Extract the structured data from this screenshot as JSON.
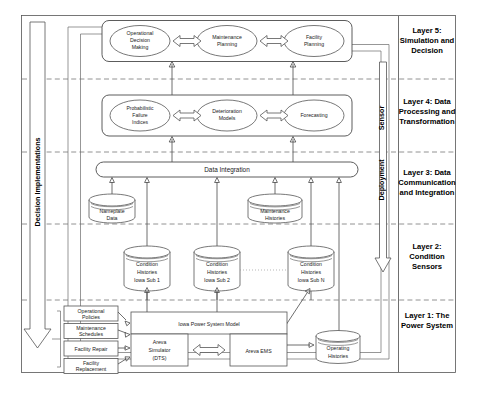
{
  "diagram": {
    "vertical_labels": {
      "left": "Decision Implementations",
      "right_top": "Sensor",
      "right_bottom": "Deployment"
    },
    "layers": [
      {
        "id": "layer5",
        "label_lines": [
          "Layer 5:",
          "Simulation and",
          "Decision"
        ]
      },
      {
        "id": "layer4",
        "label_lines": [
          "Layer 4: Data",
          "Processing and",
          "Transformation"
        ]
      },
      {
        "id": "layer3",
        "label_lines": [
          "Layer 3: Data",
          "Communication",
          "and Integration"
        ]
      },
      {
        "id": "layer2",
        "label_lines": [
          "Layer 2:",
          "Condition",
          "Sensors"
        ]
      },
      {
        "id": "layer1",
        "label_lines": [
          "Layer 1: The",
          "Power System"
        ]
      }
    ],
    "layer5_nodes": [
      {
        "id": "operational-decision-making",
        "lines": [
          "Operational",
          "Decision",
          "Making"
        ]
      },
      {
        "id": "maintenance-planning",
        "lines": [
          "Maintenance",
          "Planning"
        ]
      },
      {
        "id": "facility-planning",
        "lines": [
          "Facility",
          "Planning"
        ]
      }
    ],
    "layer4_nodes": [
      {
        "id": "probabilistic-failure-indices",
        "lines": [
          "Probabilistic",
          "Failure",
          "Indices"
        ]
      },
      {
        "id": "deterioration-models",
        "lines": [
          "Deterioration",
          "Models"
        ]
      },
      {
        "id": "forecasting",
        "lines": [
          "Forecasting"
        ]
      }
    ],
    "layer3": {
      "integration_bar": "Data Integration",
      "stores": [
        {
          "id": "nameplate-data",
          "lines": [
            "Nameplate",
            "Data"
          ]
        },
        {
          "id": "maintenance-histories",
          "lines": [
            "Maintenance",
            "Histories"
          ]
        }
      ]
    },
    "layer2": {
      "stores": [
        {
          "id": "condition-histories-sub1",
          "lines": [
            "Condition",
            "Histories",
            "Iowa Sub 1"
          ]
        },
        {
          "id": "condition-histories-sub2",
          "lines": [
            "Condition",
            "Histories",
            "Iowa Sub 2"
          ]
        },
        {
          "id": "condition-histories-subn",
          "lines": [
            "Condition",
            "Histories",
            "Iowa Sub N"
          ]
        }
      ]
    },
    "layer1": {
      "inputs": [
        {
          "id": "operational-policies",
          "lines": [
            "Operational",
            "Policies"
          ]
        },
        {
          "id": "maintenance-schedules",
          "lines": [
            "Maintenance",
            "Schedules"
          ]
        },
        {
          "id": "facility-repair",
          "lines": [
            "Facility Repair"
          ]
        },
        {
          "id": "facility-replacement",
          "lines": [
            "Facility",
            "Replacement"
          ]
        }
      ],
      "model": "Iowa Power System Model",
      "simulator": [
        "Areva",
        "Simulator",
        "(DTS)"
      ],
      "ems": "Areva EMS",
      "operating_histories": [
        "Operating",
        "Histories"
      ]
    },
    "colors": {
      "stroke": "#555555",
      "text": "#1a1a1a",
      "divider": "#777777",
      "background": "#ffffff"
    }
  }
}
